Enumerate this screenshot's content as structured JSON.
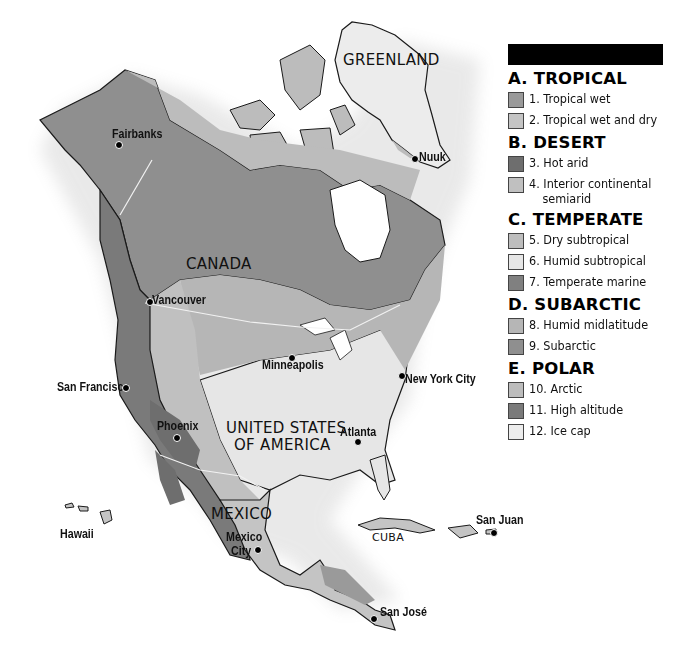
{
  "map": {
    "title": "",
    "top_caption": "",
    "country_labels": {
      "greenland": "GREENLAND",
      "canada": "CANADA",
      "usa_line1": "UNITED STATES",
      "usa_line2": "OF AMERICA",
      "mexico": "MEXICO",
      "cuba": "CUBA"
    },
    "cities": {
      "fairbanks": "Fairbanks",
      "nuuk": "Nuuk",
      "vancouver": "Vancouver",
      "minneapolis": "Minneapolis",
      "new_york": "New York City",
      "san_francisco": "San Francisco",
      "phoenix": "Phoenix",
      "atlanta": "Atlanta",
      "hawaii": "Hawaii",
      "mexico_city_line1": "Mexico",
      "mexico_city_line2": "City",
      "san_juan": "San Juan",
      "san_jose": "San José"
    },
    "colors": {
      "water": "#ffffff",
      "tropical_wet": "#9a9a9a",
      "tropical_wet_dry": "#c4c4c4",
      "hot_arid": "#6e6e6e",
      "semiarid": "#c0c0c0",
      "dry_subtropical": "#bdbdbd",
      "humid_subtropical": "#e6e6e6",
      "temperate_marine": "#808080",
      "humid_midlatitude": "#b6b6b6",
      "subarctic": "#8f8f8f",
      "arctic": "#bcbcbc",
      "high_altitude": "#7a7a7a",
      "ice_cap": "#ececec",
      "coast": "#1a1a1a",
      "border": "#f2f2f2"
    }
  },
  "legend": {
    "title": "",
    "categories": [
      {
        "heading": "A. TROPICAL",
        "items": [
          {
            "label": "1. Tropical wet",
            "color": "#9a9a9a"
          },
          {
            "label": "2. Tropical wet and dry",
            "color": "#c4c4c4"
          }
        ]
      },
      {
        "heading": "B. DESERT",
        "items": [
          {
            "label": "3. Hot arid",
            "color": "#6e6e6e"
          },
          {
            "label": "4. Interior continental",
            "label2": "semiarid",
            "color": "#c0c0c0"
          }
        ]
      },
      {
        "heading": "C. TEMPERATE",
        "items": [
          {
            "label": "5. Dry subtropical",
            "color": "#bdbdbd"
          },
          {
            "label": "6. Humid subtropical",
            "color": "#e6e6e6"
          },
          {
            "label": "7. Temperate marine",
            "color": "#808080"
          }
        ]
      },
      {
        "heading": "D. SUBARCTIC",
        "items": [
          {
            "label": "8. Humid midlatitude",
            "color": "#b6b6b6"
          },
          {
            "label": "9. Subarctic",
            "color": "#8f8f8f"
          }
        ]
      },
      {
        "heading": "E. POLAR",
        "items": [
          {
            "label": "10. Arctic",
            "color": "#bcbcbc"
          },
          {
            "label": "11. High altitude",
            "color": "#7a7a7a"
          },
          {
            "label": "12. Ice cap",
            "color": "#ececec"
          }
        ]
      }
    ]
  }
}
